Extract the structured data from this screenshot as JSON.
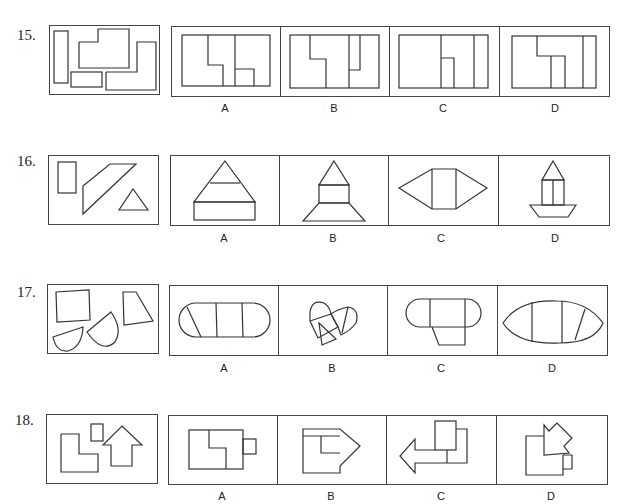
{
  "questions": [
    {
      "number": "15.",
      "options": [
        "A",
        "B",
        "C",
        "D"
      ]
    },
    {
      "number": "16.",
      "options": [
        "A",
        "B",
        "C",
        "D"
      ]
    },
    {
      "number": "17.",
      "options": [
        "A",
        "B",
        "C",
        "D"
      ]
    },
    {
      "number": "18.",
      "options": [
        "A",
        "B",
        "C",
        "D"
      ]
    }
  ],
  "figures": {
    "q15": {
      "question": "rectangle, L-shape pieces, small rectangles",
      "A": "rectangle composed with L-pieces",
      "B": "rectangle composed with L-pieces",
      "C": "rectangle composed with L-pieces",
      "D": "rectangle composed with L-pieces"
    },
    "q16": {
      "question": "rectangle, parallelogram, triangle",
      "A": "stacked triangle/trapezoid/rectangle",
      "B": "house on trapezoid",
      "C": "hexagon with rectangle",
      "D": "boat with house"
    },
    "q17": {
      "question": "square, sectors, trapezoid",
      "A": "stadium shape divided",
      "B": "heart shape",
      "C": "rounded rectangle with trapezoid",
      "D": "lens shape divided"
    },
    "q18": {
      "question": "L-shape, small square, arrow",
      "A": "rectangle with L and small square",
      "B": "right arrow composite",
      "C": "left arrow composite",
      "D": "diagonal arrow composite"
    }
  }
}
